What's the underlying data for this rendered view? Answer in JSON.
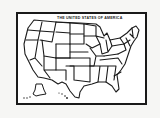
{
  "map": {
    "title": "THE UNITED STATES OF AMERICA",
    "style": "hand-drawn black outline",
    "line_color": "#1a1a1a",
    "fill_color": "#ffffff",
    "background_color": "#f6f6f4",
    "insets": [
      "Alaska",
      "Hawaii"
    ]
  }
}
